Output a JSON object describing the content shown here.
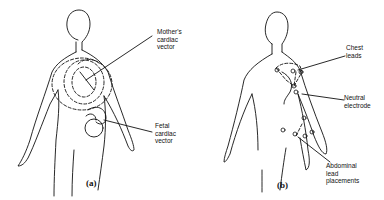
{
  "figure_a": {
    "caption": "(a)",
    "labels": {
      "mother_vector": [
        "Mother's",
        "cardiac",
        "vector"
      ],
      "fetal_vector": [
        "Fetal",
        "cardiac",
        "vector"
      ]
    }
  },
  "figure_b": {
    "caption": "(b)",
    "labels": {
      "chest_leads": [
        "Chest",
        "leads"
      ],
      "neutral_electrode": [
        "Neutral",
        "electrode"
      ],
      "abdominal_leads": [
        "Abdominal",
        "lead",
        "placements"
      ]
    }
  }
}
